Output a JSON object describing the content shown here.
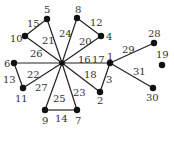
{
  "diagram": {
    "type": "graph",
    "nodes": [
      {
        "id": "hub",
        "label": "",
        "x": 62,
        "y": 63
      },
      {
        "id": "5",
        "label": "5",
        "x": 47,
        "y": 19,
        "lx": 44,
        "ly": 13
      },
      {
        "id": "10",
        "label": "10",
        "x": 25,
        "y": 36,
        "lx": 10,
        "ly": 42
      },
      {
        "id": "8",
        "label": "8",
        "x": 77,
        "y": 18,
        "lx": 75,
        "ly": 13
      },
      {
        "id": "4",
        "label": "4",
        "x": 101,
        "y": 36,
        "lx": 106,
        "ly": 40
      },
      {
        "id": "6",
        "label": "6",
        "x": 14,
        "y": 63,
        "lx": 4,
        "ly": 67
      },
      {
        "id": "11",
        "label": "11",
        "x": 23,
        "y": 88,
        "lx": 15,
        "ly": 102
      },
      {
        "id": "1",
        "label": "1",
        "x": 110,
        "y": 63,
        "lx": 107,
        "ly": 60
      },
      {
        "id": "28",
        "label": "28",
        "x": 154,
        "y": 43,
        "lx": 148,
        "ly": 37
      },
      {
        "id": "19",
        "label": "19",
        "x": 162,
        "y": 65,
        "lx": 156,
        "ly": 58
      },
      {
        "id": "30",
        "label": "30",
        "x": 153,
        "y": 88,
        "lx": 146,
        "ly": 101
      },
      {
        "id": "2",
        "label": "2",
        "x": 100,
        "y": 92,
        "lx": 97,
        "ly": 104
      },
      {
        "id": "9",
        "label": "9",
        "x": 45,
        "y": 110,
        "lx": 42,
        "ly": 124
      },
      {
        "id": "7",
        "label": "7",
        "x": 77,
        "y": 110,
        "lx": 75,
        "ly": 124
      }
    ],
    "edges": [
      {
        "from": "5",
        "to": "10",
        "label": "15",
        "lx": 27,
        "ly": 27
      },
      {
        "from": "hub",
        "to": "5",
        "label": "21",
        "lx": 42,
        "ly": 44
      },
      {
        "from": "hub",
        "to": "10",
        "label": "26",
        "lx": 30,
        "ly": 57
      },
      {
        "from": "hub",
        "to": "8",
        "label": "24",
        "lx": 59,
        "ly": 37
      },
      {
        "from": "8",
        "to": "4",
        "label": "12",
        "lx": 90,
        "ly": 26
      },
      {
        "from": "hub",
        "to": "4",
        "label": "20",
        "lx": 79,
        "ly": 45
      },
      {
        "from": "hub",
        "to": "6",
        "label": "22",
        "lx": 27,
        "ly": 78
      },
      {
        "from": "6",
        "to": "11",
        "label": "13",
        "lx": 3,
        "ly": 83
      },
      {
        "from": "hub",
        "to": "11",
        "label": "27",
        "lx": 35,
        "ly": 91
      },
      {
        "from": "hub",
        "to": "1",
        "label": "",
        "lx": 0,
        "ly": 0
      },
      {
        "from": "1",
        "to": "28",
        "label": "29",
        "lx": 122,
        "ly": 53
      },
      {
        "from": "1",
        "to": "30",
        "label": "31",
        "lx": 133,
        "ly": 75
      },
      {
        "from": "1",
        "to": "2",
        "label": "3",
        "lx": 106,
        "ly": 83
      },
      {
        "from": "hub",
        "to": "2",
        "label": "18",
        "lx": 84,
        "ly": 78
      },
      {
        "from": "hub",
        "to": "9",
        "label": "25",
        "lx": 53,
        "ly": 102
      },
      {
        "from": "hub",
        "to": "7",
        "label": "23",
        "lx": 73,
        "ly": 96
      },
      {
        "from": "9",
        "to": "7",
        "label": "14",
        "lx": 55,
        "ly": 122
      }
    ],
    "extra_labels": [
      {
        "text": "16",
        "x": 78,
        "y": 63
      },
      {
        "text": "17",
        "x": 92,
        "y": 63
      }
    ]
  }
}
